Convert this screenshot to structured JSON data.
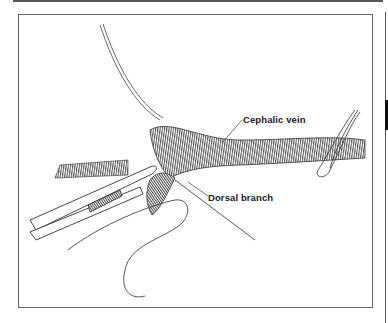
{
  "figure": {
    "labels": {
      "cephalic_vein": "Cephalic vein",
      "dorsal_branch": "Dorsal branch"
    },
    "colors": {
      "ink": "#2a2a2a",
      "frame": "#666666",
      "background": "#ffffff"
    }
  }
}
